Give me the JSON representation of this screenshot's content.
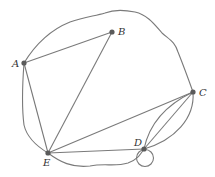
{
  "diagram": {
    "type": "multigraph",
    "nodes": [
      {
        "id": "A",
        "label": "A",
        "x": 24,
        "y": 63,
        "label_x": 12,
        "label_y": 67
      },
      {
        "id": "B",
        "label": "B",
        "x": 112,
        "y": 32,
        "label_x": 118,
        "label_y": 35
      },
      {
        "id": "C",
        "label": "C",
        "x": 193,
        "y": 92,
        "label_x": 199,
        "label_y": 96
      },
      {
        "id": "D",
        "label": "D",
        "x": 144,
        "y": 149,
        "label_x": 134,
        "label_y": 146
      },
      {
        "id": "E",
        "label": "E",
        "x": 48,
        "y": 153,
        "label_x": 43,
        "label_y": 166
      }
    ],
    "edges": [
      {
        "from": "A",
        "to": "B",
        "kind": "straight"
      },
      {
        "from": "A",
        "to": "E",
        "kind": "straight"
      },
      {
        "from": "A",
        "to": "E",
        "kind": "curved"
      },
      {
        "from": "B",
        "to": "E",
        "kind": "straight"
      },
      {
        "from": "A",
        "to": "C",
        "kind": "curved-outer"
      },
      {
        "from": "E",
        "to": "C",
        "kind": "straight"
      },
      {
        "from": "E",
        "to": "D",
        "kind": "straight"
      },
      {
        "from": "E",
        "to": "D",
        "kind": "curved"
      },
      {
        "from": "C",
        "to": "D",
        "kind": "straight"
      },
      {
        "from": "C",
        "to": "D",
        "kind": "curved-left"
      },
      {
        "from": "C",
        "to": "D",
        "kind": "curved-right"
      },
      {
        "from": "D",
        "to": "D",
        "kind": "loop"
      }
    ],
    "colors": {
      "edge": "#7a7a7a",
      "node": "#5a5a5a",
      "label": "#333333",
      "background": "#ffffff"
    }
  }
}
